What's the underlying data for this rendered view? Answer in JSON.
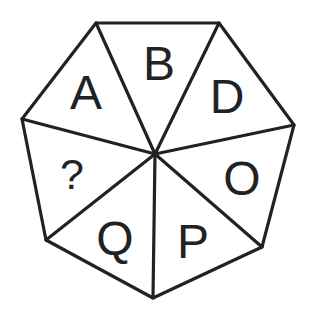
{
  "puzzle": {
    "shape": "heptagon",
    "title": "",
    "colors": {
      "line": "#222222",
      "text": "#222222",
      "background": "#ffffff"
    },
    "segments": [
      {
        "position": "upper-left",
        "label": "A"
      },
      {
        "position": "top",
        "label": "B"
      },
      {
        "position": "upper-right",
        "label": "D"
      },
      {
        "position": "lower-right",
        "label": "O"
      },
      {
        "position": "bottom-right",
        "label": "P"
      },
      {
        "position": "bottom-left",
        "label": "Q"
      },
      {
        "position": "left",
        "label": "?"
      }
    ],
    "missing_marker": "?"
  }
}
